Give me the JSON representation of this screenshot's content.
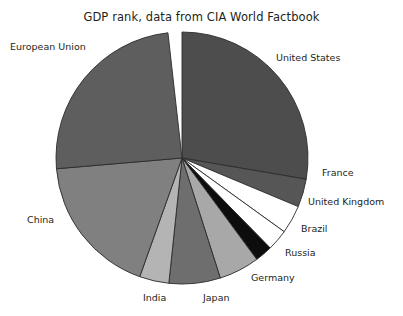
{
  "chart_data": {
    "type": "pie",
    "title": "GDP rank, data from CIA World Factbook",
    "xlabel": "",
    "ylabel": "",
    "legend": "none",
    "labels_position": "outside",
    "start_angle_deg": 90,
    "direction": "clockwise",
    "center_px": [
      182,
      158
    ],
    "radius_px": 126,
    "categories": [
      "United States",
      "France",
      "United Kingdom",
      "Brazil",
      "Russia",
      "Germany",
      "Japan",
      "India",
      "China",
      "European Union"
    ],
    "values": [
      21.4,
      2.8,
      2.8,
      2.1,
      1.7,
      4.0,
      5.1,
      2.9,
      14.1,
      19.0
    ],
    "percentages": [
      27.7,
      3.6,
      3.6,
      2.7,
      2.2,
      5.2,
      6.6,
      3.8,
      18.2,
      24.6
    ],
    "slice_angles_deg": [
      99.7,
      13.0,
      13.1,
      9.8,
      8.0,
      18.7,
      23.7,
      13.6,
      65.5,
      88.5
    ],
    "colors": [
      "#4d4d4d",
      "#565656",
      "#ffffff",
      "#ffffff",
      "#0d0d0d",
      "#a8a8a8",
      "#6e6e6e",
      "#b4b4b4",
      "#808080",
      "#5e5e5e"
    ],
    "edge_color": "#2b2b2b"
  },
  "labels": [
    {
      "name": "european-union",
      "text": "European Union",
      "x": 10,
      "y": 41
    },
    {
      "name": "united-states",
      "text": "United States",
      "x": 276,
      "y": 52
    },
    {
      "name": "france",
      "text": "France",
      "x": 322,
      "y": 167
    },
    {
      "name": "united-kingdom",
      "text": "United Kingdom",
      "x": 308,
      "y": 196
    },
    {
      "name": "brazil",
      "text": "Brazil",
      "x": 301,
      "y": 223
    },
    {
      "name": "russia",
      "text": "Russia",
      "x": 285,
      "y": 247
    },
    {
      "name": "germany",
      "text": "Germany",
      "x": 251,
      "y": 272
    },
    {
      "name": "japan",
      "text": "Japan",
      "x": 203,
      "y": 292
    },
    {
      "name": "india",
      "text": "India",
      "x": 143,
      "y": 292
    },
    {
      "name": "china",
      "text": "China",
      "x": 27,
      "y": 214
    }
  ]
}
